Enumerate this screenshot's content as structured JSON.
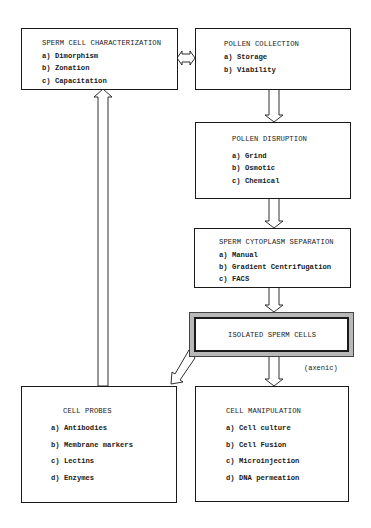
{
  "boxes": {
    "sperm_cell_characterization": {
      "title": "SPERM CELL CHARACTERIZATION",
      "items": [
        "a) Dimorphism",
        "b) Zonation",
        "c) Capacitation"
      ]
    },
    "pollen_collection": {
      "title": "POLLEN COLLECTION",
      "items": [
        "a) Storage",
        "b) Viability"
      ]
    },
    "pollen_disruption": {
      "title": "POLLEN DISRUPTION",
      "items": [
        "a) Grind",
        "b) Osmotic",
        "c) Chemical"
      ]
    },
    "sperm_cytoplasm_separation": {
      "title": "SPERM CYTOPLASM SEPARATION",
      "items": [
        "a) Manual",
        "b) Gradient Centrifugation",
        "c) FACS"
      ]
    },
    "isolated_sperm_cells": {
      "title": "ISOLATED SPERM CELLS"
    },
    "cell_probes": {
      "title": "CELL PROBES",
      "items": [
        "a) Antibodies",
        "b) Membrane markers",
        "c) Lectins",
        "d) Enzymes"
      ]
    },
    "cell_manipulation": {
      "title": "CELL MANIPULATION",
      "items": [
        "a) Cell culture",
        "b) Cell Fusion",
        "c) Microinjection",
        "d) DNA permeation"
      ]
    }
  },
  "annotations": {
    "axenic": "(axenic)"
  },
  "colors": {
    "line": "#1a1a1a",
    "highlight_frame": "#b8b8b8"
  }
}
